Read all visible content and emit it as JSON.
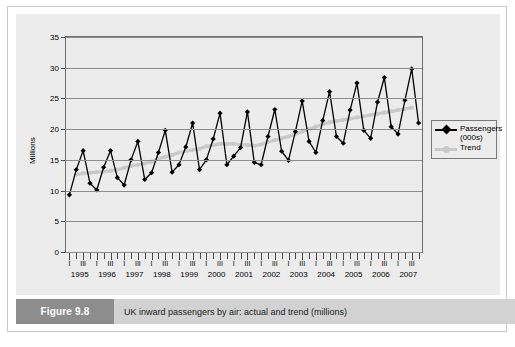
{
  "figure": {
    "tag": "Figure 9.8",
    "caption": "UK inward passengers by air: actual and trend (millions)"
  },
  "legend": {
    "items": [
      {
        "label": "Passengers (000s)",
        "line1": "Passengers",
        "line2": "(000s)",
        "marker": "diamond-marker-icon",
        "color": "#000000"
      },
      {
        "label": "Trend",
        "line1": "Trend",
        "line2": "",
        "marker": "circle-marker-icon",
        "color": "#c9c9c9"
      }
    ]
  },
  "chart_data": {
    "type": "line",
    "title": "UK inward passengers by air: actual and trend (millions)",
    "xlabel": "",
    "ylabel": "Millions",
    "ylim": [
      0,
      35
    ],
    "yticks": [
      0,
      5,
      10,
      15,
      20,
      25,
      30,
      35
    ],
    "grid": true,
    "legend_position": "right",
    "years": [
      "1995",
      "1996",
      "1997",
      "1998",
      "1999",
      "2000",
      "2001",
      "2002",
      "2003",
      "2004",
      "2005",
      "2006",
      "2007"
    ],
    "quarter_labels": [
      "I",
      "",
      "III",
      ""
    ],
    "x": [
      "1995 Q1",
      "1995 Q2",
      "1995 Q3",
      "1995 Q4",
      "1996 Q1",
      "1996 Q2",
      "1996 Q3",
      "1996 Q4",
      "1997 Q1",
      "1997 Q2",
      "1997 Q3",
      "1997 Q4",
      "1998 Q1",
      "1998 Q2",
      "1998 Q3",
      "1998 Q4",
      "1999 Q1",
      "1999 Q2",
      "1999 Q3",
      "1999 Q4",
      "2000 Q1",
      "2000 Q2",
      "2000 Q3",
      "2000 Q4",
      "2001 Q1",
      "2001 Q2",
      "2001 Q3",
      "2001 Q4",
      "2002 Q1",
      "2002 Q2",
      "2002 Q3",
      "2002 Q4",
      "2003 Q1",
      "2003 Q2",
      "2003 Q3",
      "2003 Q4",
      "2004 Q1",
      "2004 Q2",
      "2004 Q3",
      "2004 Q4",
      "2005 Q1",
      "2005 Q2",
      "2005 Q3",
      "2005 Q4",
      "2006 Q1",
      "2006 Q2",
      "2006 Q3",
      "2006 Q4",
      "2007 Q1",
      "2007 Q2",
      "2007 Q3",
      "2007 Q4"
    ],
    "series": [
      {
        "name": "Passengers (000s)",
        "color": "#000000",
        "marker": "diamond",
        "values": [
          9.3,
          13.4,
          16.5,
          11.2,
          10.1,
          13.8,
          16.5,
          12.1,
          10.9,
          15.0,
          18.0,
          11.8,
          12.9,
          16.2,
          19.8,
          13.0,
          14.2,
          17.1,
          21.0,
          13.4,
          15.0,
          18.4,
          22.6,
          14.2,
          15.6,
          17.0,
          22.8,
          14.6,
          14.2,
          18.8,
          23.2,
          16.4,
          14.9,
          19.6,
          24.6,
          18.0,
          16.2,
          21.4,
          26.1,
          18.8,
          17.7,
          23.1,
          27.5,
          19.8,
          18.5,
          24.4,
          28.4,
          20.4,
          19.2,
          24.7,
          29.8,
          21.0
        ]
      },
      {
        "name": "Trend",
        "color": "#c9c9c9",
        "marker": "circle",
        "values": [
          null,
          12.6,
          12.8,
          12.9,
          13.0,
          13.1,
          13.2,
          13.4,
          13.7,
          14.0,
          14.2,
          14.4,
          14.7,
          15.2,
          15.5,
          15.8,
          16.2,
          16.4,
          16.6,
          16.8,
          17.2,
          17.4,
          17.6,
          17.6,
          17.6,
          17.5,
          17.4,
          17.3,
          17.5,
          17.9,
          18.2,
          18.5,
          18.8,
          19.2,
          19.6,
          20.0,
          20.4,
          20.8,
          21.1,
          21.3,
          21.5,
          21.7,
          21.9,
          22.1,
          22.3,
          22.5,
          22.7,
          22.9,
          23.1,
          23.3,
          23.5,
          null
        ]
      }
    ]
  }
}
